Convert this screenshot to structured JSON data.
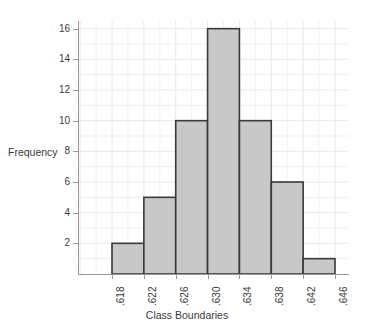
{
  "chart_data": {
    "type": "bar",
    "title": "",
    "subtitle": "",
    "xlabel": "Class Boundaries",
    "ylabel": "Frequency",
    "categories": [
      ".618-.622",
      ".622-.626",
      ".626-.630",
      ".630-.634",
      ".634-.638",
      ".638-.642",
      ".642-.646"
    ],
    "bin_edges": [
      0.618,
      0.622,
      0.626,
      0.63,
      0.634,
      0.638,
      0.642,
      0.646
    ],
    "values": [
      2,
      5,
      10,
      16,
      10,
      6,
      1
    ],
    "x_tick_labels": [
      ".618",
      ".622",
      ".626",
      ".630",
      ".634",
      ".638",
      ".642",
      ".646"
    ],
    "y_tick_labels": [
      "2",
      "4",
      "6",
      "8",
      "10",
      "12",
      "14",
      "16"
    ],
    "y_ticks": [
      2,
      4,
      6,
      8,
      10,
      12,
      14,
      16
    ],
    "ylim": [
      0,
      16.5
    ],
    "xlim": [
      0.618,
      0.646
    ],
    "grid": true,
    "legend": "none",
    "bar_fill": "#c8c8c8",
    "bar_stroke": "#3a3a3a",
    "grid_color": "#e8e8e8",
    "axis_color": "#9a9a9a",
    "total_count": 50
  }
}
